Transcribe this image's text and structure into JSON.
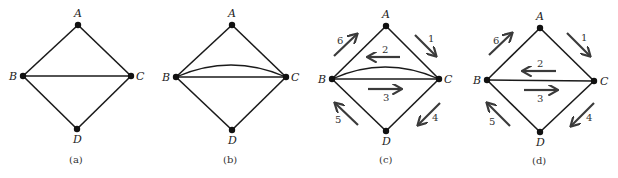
{
  "panels": [
    {
      "id": "a",
      "caption": "(a)",
      "nodes": [
        {
          "label": "A",
          "x": 78,
          "y": 25
        },
        {
          "label": "B",
          "x": 23,
          "y": 76
        },
        {
          "label": "C",
          "x": 131,
          "y": 76
        },
        {
          "label": "D",
          "x": 77,
          "y": 129
        }
      ],
      "edges": [
        [
          "A",
          "B"
        ],
        [
          "A",
          "C"
        ],
        [
          "B",
          "C"
        ],
        [
          "B",
          "D"
        ],
        [
          "C",
          "D"
        ]
      ],
      "double_edge_BC": false,
      "arrows": []
    },
    {
      "id": "b",
      "caption": "(b)",
      "nodes": [
        {
          "label": "A",
          "x": 232,
          "y": 25
        },
        {
          "label": "B",
          "x": 176,
          "y": 77
        },
        {
          "label": "C",
          "x": 286,
          "y": 77
        },
        {
          "label": "D",
          "x": 232,
          "y": 130
        }
      ],
      "edges": [
        [
          "A",
          "B"
        ],
        [
          "A",
          "C"
        ],
        [
          "B",
          "C"
        ],
        [
          "B",
          "D"
        ],
        [
          "C",
          "D"
        ]
      ],
      "double_edge_BC": true,
      "arrows": []
    },
    {
      "id": "c",
      "caption": "(c)",
      "nodes": [
        {
          "label": "A",
          "x": 386,
          "y": 26
        },
        {
          "label": "B",
          "x": 332,
          "y": 79
        },
        {
          "label": "C",
          "x": 439,
          "y": 79
        },
        {
          "label": "D",
          "x": 386,
          "y": 131
        }
      ],
      "edges": [
        [
          "A",
          "B"
        ],
        [
          "A",
          "C"
        ],
        [
          "B",
          "C"
        ],
        [
          "B",
          "D"
        ],
        [
          "C",
          "D"
        ]
      ],
      "double_edge_BC": true,
      "arrows": [
        {
          "num": "1",
          "from": "A",
          "to": "C"
        },
        {
          "num": "2",
          "from": "C",
          "to": "B"
        },
        {
          "num": "3",
          "from": "B",
          "to": "C"
        },
        {
          "num": "4",
          "from": "C",
          "to": "D"
        },
        {
          "num": "5",
          "from": "D",
          "to": "B"
        },
        {
          "num": "6",
          "from": "B",
          "to": "A"
        }
      ]
    },
    {
      "id": "d",
      "caption": "(d)",
      "nodes": [
        {
          "label": "A",
          "x": 540,
          "y": 28
        },
        {
          "label": "B",
          "x": 487,
          "y": 80
        },
        {
          "label": "C",
          "x": 594,
          "y": 81
        },
        {
          "label": "D",
          "x": 540,
          "y": 132
        }
      ],
      "edges": [
        [
          "A",
          "B"
        ],
        [
          "A",
          "C"
        ],
        [
          "B",
          "C"
        ],
        [
          "B",
          "D"
        ],
        [
          "C",
          "D"
        ]
      ],
      "double_edge_BC": false,
      "arrows": [
        {
          "num": "1",
          "from": "A",
          "to": "C"
        },
        {
          "num": "2",
          "from": "C",
          "to": "B"
        },
        {
          "num": "3",
          "from": "B",
          "to": "C"
        },
        {
          "num": "4",
          "from": "C",
          "to": "D"
        },
        {
          "num": "5",
          "from": "D",
          "to": "B"
        },
        {
          "num": "6",
          "from": "B",
          "to": "A"
        }
      ]
    }
  ],
  "colors": {
    "edge": "#1a1a1a",
    "node": "#111111",
    "arrow": "#3a3a3a",
    "background": "#ffffff"
  }
}
